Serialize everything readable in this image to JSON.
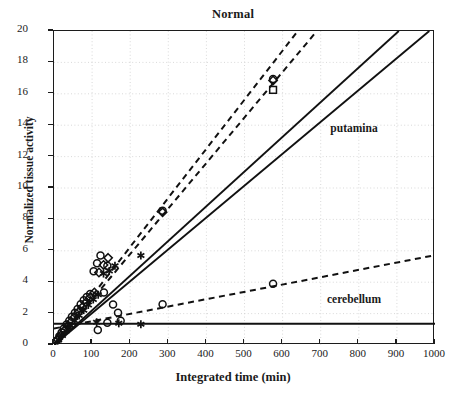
{
  "chart_data": {
    "type": "scatter",
    "title": "Normal",
    "xlabel": "Integrated time (min)",
    "ylabel": "Normalized tissue activity",
    "xlim": [
      0,
      1000
    ],
    "ylim": [
      0,
      20
    ],
    "xticks": [
      0,
      100,
      200,
      300,
      400,
      500,
      600,
      700,
      800,
      900,
      1000
    ],
    "yticks": [
      0,
      2,
      4,
      6,
      8,
      10,
      12,
      14,
      16,
      18,
      20
    ],
    "grid": "dotted",
    "legend_position": "inline-annotation",
    "annotations": [
      {
        "text": "putamina",
        "x": 790,
        "y": 13.6
      },
      {
        "text": "cerebellum",
        "x": 790,
        "y": 2.75
      }
    ],
    "series": [
      {
        "name": "putamina-fit-dashed-1",
        "style": "dashed",
        "marker": "none",
        "x": [
          0,
          640
        ],
        "values": [
          0.0,
          20.0
        ]
      },
      {
        "name": "putamina-fit-dashed-2",
        "style": "dashed",
        "marker": "none",
        "x": [
          0,
          690
        ],
        "values": [
          0.0,
          20.0
        ]
      },
      {
        "name": "putamina-fit-solid-1",
        "style": "solid",
        "marker": "none",
        "x": [
          0,
          905
        ],
        "values": [
          0.0,
          20.0
        ]
      },
      {
        "name": "putamina-fit-solid-2",
        "style": "solid",
        "marker": "none",
        "x": [
          0,
          985
        ],
        "values": [
          0.0,
          20.0
        ]
      },
      {
        "name": "cerebellum-fit-dashed",
        "style": "dashed",
        "marker": "none",
        "x": [
          0,
          1000
        ],
        "values": [
          1.05,
          5.72
        ]
      },
      {
        "name": "cerebellum-fit-solid",
        "style": "solid",
        "marker": "none",
        "x": [
          0,
          1000
        ],
        "values": [
          1.35,
          1.35
        ]
      },
      {
        "name": "putamina-circles",
        "style": "none",
        "marker": "circle",
        "x": [
          8,
          14,
          20,
          26,
          33,
          40,
          47,
          55,
          62,
          70,
          78,
          86,
          95,
          104,
          113,
          122,
          131,
          140,
          285,
          575
        ],
        "values": [
          0.3,
          0.55,
          0.8,
          1.05,
          1.3,
          1.55,
          1.8,
          2.05,
          2.3,
          2.6,
          2.85,
          3.05,
          3.25,
          4.7,
          5.2,
          5.7,
          3.35,
          5.05,
          8.55,
          16.95
        ]
      },
      {
        "name": "putamina-diamonds",
        "style": "none",
        "marker": "diamond",
        "x": [
          10,
          18,
          27,
          36,
          45,
          54,
          64,
          74,
          84,
          95,
          106,
          118,
          130,
          142,
          285,
          575
        ],
        "values": [
          0.35,
          0.62,
          0.92,
          1.2,
          1.48,
          1.78,
          2.08,
          2.4,
          2.72,
          3.02,
          3.35,
          4.62,
          5.1,
          5.55,
          8.45,
          16.85
        ]
      },
      {
        "name": "putamina-asterisks",
        "style": "none",
        "marker": "asterisk",
        "x": [
          12,
          22,
          32,
          43,
          54,
          66,
          78,
          90,
          103,
          116,
          130,
          145,
          160,
          228
        ],
        "values": [
          0.32,
          0.6,
          0.9,
          1.22,
          1.55,
          1.88,
          2.22,
          2.55,
          2.9,
          3.2,
          4.55,
          4.72,
          5.05,
          5.7
        ]
      },
      {
        "name": "putamina-squares",
        "style": "none",
        "marker": "square",
        "x": [
          575
        ],
        "values": [
          16.25
        ]
      },
      {
        "name": "cerebellum-circles",
        "style": "none",
        "marker": "circle",
        "x": [
          115,
          140,
          155,
          168,
          175,
          285,
          575
        ],
        "values": [
          0.95,
          1.42,
          2.58,
          2.05,
          1.55,
          2.6,
          3.9
        ]
      },
      {
        "name": "cerebellum-asterisks",
        "style": "none",
        "marker": "asterisk",
        "x": [
          112,
          170,
          228
        ],
        "values": [
          1.45,
          1.38,
          1.32
        ]
      }
    ]
  }
}
